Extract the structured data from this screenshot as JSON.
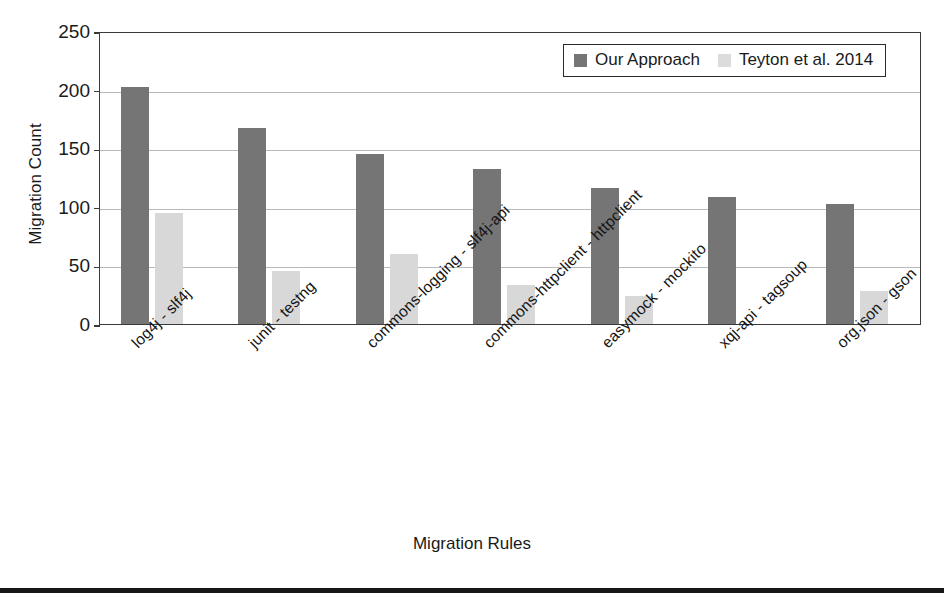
{
  "chart_data": {
    "type": "bar",
    "title": "",
    "xlabel": "Migration Rules",
    "ylabel": "Migration Count",
    "ylim": [
      0,
      250
    ],
    "yticks": [
      0,
      50,
      100,
      150,
      200,
      250
    ],
    "ytick_labels": [
      "0",
      "50",
      "100",
      "150",
      "200",
      "250"
    ],
    "grid": true,
    "legend_position": "top-right",
    "categories": [
      "log4j - slf4j",
      "junit - testng",
      "commons-logging - slf4j-api",
      "commons-httpclient - httpclient",
      "easymock - mockito",
      "xqj-api - tagsoup",
      "org.json - gson"
    ],
    "series": [
      {
        "name": "Our Approach",
        "color": "#757575",
        "values": [
          202,
          167,
          145,
          132,
          116,
          108,
          102
        ]
      },
      {
        "name": "Teyton et al. 2014",
        "color": "#d8d8d8",
        "values": [
          95,
          45,
          60,
          33,
          24,
          0,
          28
        ]
      }
    ]
  },
  "axes": {
    "y_title": "Migration Count",
    "x_title": "Migration Rules"
  },
  "legend": {
    "entries": [
      {
        "label": "Our Approach",
        "swatch": "approach-swatch"
      },
      {
        "label": "Teyton et al. 2014",
        "swatch": "teyton-swatch"
      }
    ]
  },
  "colors": {
    "series_our_approach": "#757575",
    "series_teyton": "#d8d8d8",
    "axis": "#3a3a3a",
    "gridline": "#b9b9b9",
    "text": "#1a1a1a",
    "rule": "#161616"
  }
}
